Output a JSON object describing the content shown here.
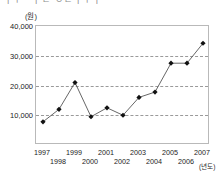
{
  "page": {
    "cut_off_heading": "ㅣㅜㅡㅣㄹ ㅇㄹㅣㅜㅏ"
  },
  "axes": {
    "y_unit_label": "(원)",
    "x_unit_label": "(년도)",
    "y_ticks": [
      "10,000",
      "20,000",
      "30,000",
      "40,000"
    ],
    "x_ticks": [
      "1997",
      "1998",
      "1999",
      "2000",
      "2001",
      "2002",
      "2003",
      "2004",
      "2005",
      "2006",
      "2007"
    ]
  },
  "style": {
    "line_color": "#555555",
    "marker_color": "#111111",
    "grid_color": "#9a9a9a",
    "frame_color": "#b9b9b9",
    "background": "#ffffff"
  },
  "chart_data": {
    "type": "line",
    "title": "",
    "subtitle": "",
    "xlabel": "(년도)",
    "ylabel": "(원)",
    "categories": [
      1997,
      1998,
      1999,
      2000,
      2001,
      2002,
      2003,
      2004,
      2005,
      2006,
      2007
    ],
    "values": [
      7800,
      12000,
      21000,
      9500,
      12500,
      10000,
      16000,
      17800,
      27500,
      27500,
      34200
    ],
    "ylim": [
      0,
      40000
    ],
    "yticks": [
      10000,
      20000,
      30000,
      40000
    ],
    "xlim": [
      1997,
      2007
    ],
    "grid": "horizontal-dashed",
    "legend": "none",
    "markers": "filled-diamond",
    "annotations": []
  }
}
